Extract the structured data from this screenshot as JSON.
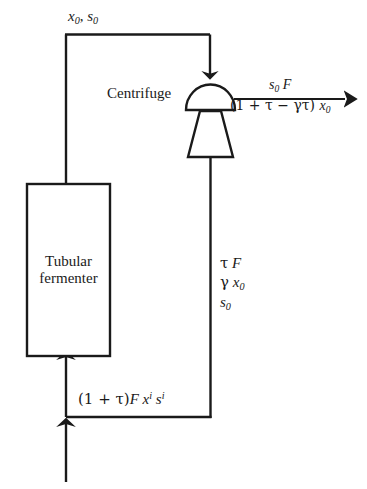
{
  "diagram": {
    "type": "process-flow",
    "background_color": "#ffffff",
    "line_color": "#1a1a1a",
    "text_color": "#1a1a1a"
  },
  "nodes": {
    "fermenter": {
      "label_line1": "Tubular",
      "label_line2": "fermenter",
      "shape": "rectangle",
      "x": 27,
      "y": 184,
      "width": 83,
      "height": 172
    },
    "centrifuge": {
      "label": "Centrifuge",
      "shape": "dome-over-trapezoid",
      "x": 185,
      "y": 83,
      "width": 50,
      "height": 74
    }
  },
  "streams": {
    "top_outlet": {
      "name": "fermenter-outlet-to-centrifuge",
      "label_x": "x",
      "label_x_sub": "0",
      "separator": ", ",
      "label_s": "s",
      "label_s_sub": "0"
    },
    "product_outlet": {
      "name": "centrifuge-product-outlet",
      "numerator_s": "s",
      "numerator_s_sub": "0",
      "numerator_F": "F",
      "denominator": "(1 + τ − γτ) ",
      "denominator_x": "x",
      "denominator_x_sub": "0"
    },
    "recycle": {
      "name": "centrifuge-recycle-stream",
      "line1_greek": "τ",
      "line1_var": "F",
      "line2_greek": "γ",
      "line2_var": "x",
      "line2_sub": "0",
      "line3_var": "s",
      "line3_sub": "0"
    },
    "feed": {
      "name": "combined-feed-to-fermenter",
      "prefix": "(1 + τ)",
      "var_F": "F",
      "var_x": "x",
      "var_x_sup": "i",
      "var_s": "s",
      "var_s_sup": "i"
    }
  }
}
